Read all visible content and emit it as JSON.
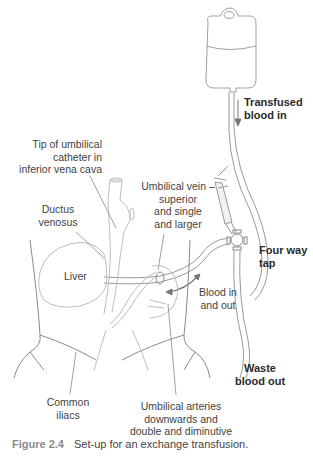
{
  "figure": {
    "label": "Figure 2.4",
    "caption": "Set-up for an exchange transfusion."
  },
  "labels": {
    "transfused_blood_in": [
      "Transfused",
      "blood in"
    ],
    "tip_of_catheter": [
      "Tip of umbilical",
      "catheter in",
      "inferior vena  cava"
    ],
    "ductus_venosus": [
      "Ductus",
      "venosus"
    ],
    "umbilical_vein": [
      "Umbilical vein –",
      "superior",
      "and single",
      "and larger"
    ],
    "liver": "Liver",
    "four_way_tap": [
      "Four way",
      "tap"
    ],
    "blood_in_out": [
      "Blood in",
      "and out"
    ],
    "waste_blood_out": [
      "Waste",
      "blood out"
    ],
    "common_iliacs": [
      "Common",
      "iliacs"
    ],
    "umbilical_arteries": [
      "Umbilical arteries",
      "downwards and",
      "double and diminutive"
    ]
  },
  "colors": {
    "line": "#9a9a9a",
    "line_light": "#bdbdbd",
    "arrow": "#777777",
    "figure_label": "#8a8a8a"
  }
}
